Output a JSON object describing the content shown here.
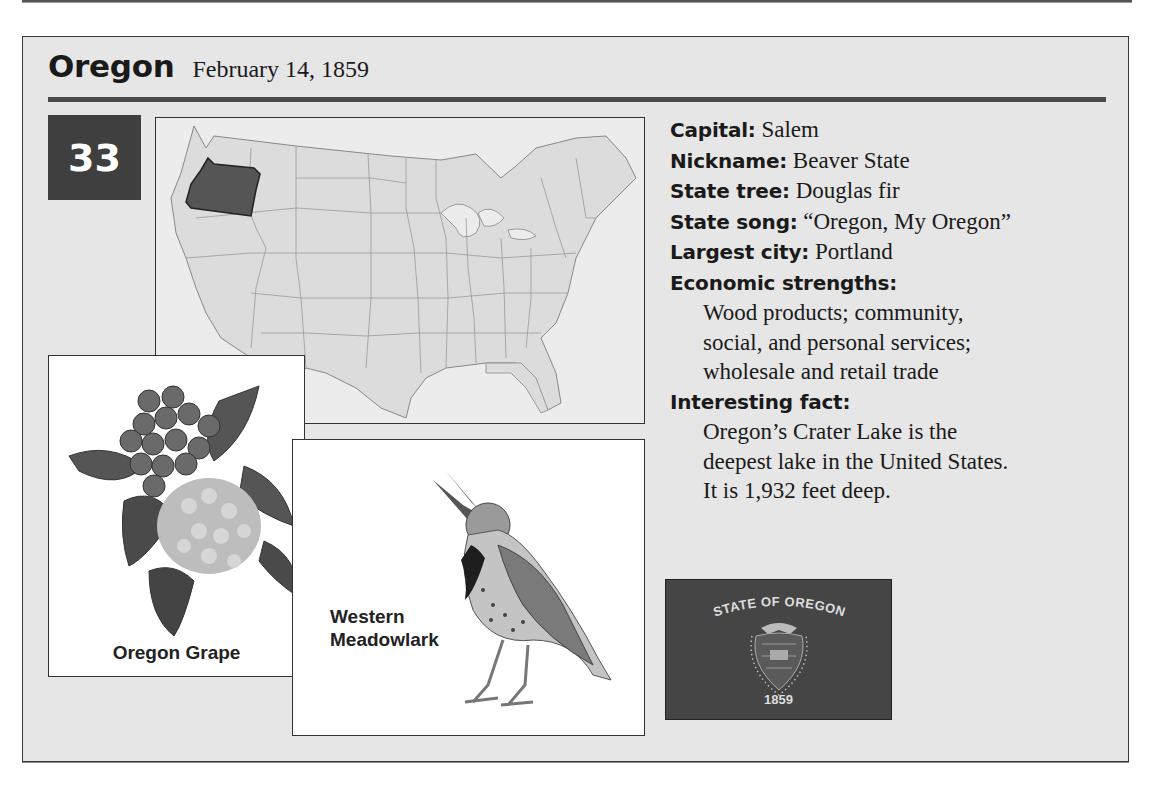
{
  "header": {
    "state_name": "Oregon",
    "admission_date": "February 14, 1859",
    "order_number": "33"
  },
  "map": {
    "highlighted_state": "Oregon",
    "highlight_color": "#555555",
    "base_color": "#dcdcdc"
  },
  "illustrations": {
    "state_flower": {
      "label": "Oregon Grape"
    },
    "state_bird": {
      "label_line1": "Western",
      "label_line2": "Meadowlark"
    }
  },
  "facts": {
    "capital": {
      "label": "Capital:",
      "value": "Salem"
    },
    "nickname": {
      "label": "Nickname:",
      "value": "Beaver State"
    },
    "state_tree": {
      "label": "State tree:",
      "value": "Douglas fir"
    },
    "state_song": {
      "label": "State song:",
      "value": "“Oregon, My Oregon”"
    },
    "largest_city": {
      "label": "Largest city:",
      "value": "Portland"
    },
    "economic_strengths": {
      "label": "Economic strengths:",
      "lines": [
        "Wood products; community,",
        "social, and personal services;",
        "wholesale and retail trade"
      ]
    },
    "interesting_fact": {
      "label": "Interesting fact:",
      "lines": [
        "Oregon’s Crater Lake is the",
        "deepest lake in the United States.",
        "It is 1,932 feet deep."
      ]
    }
  },
  "flag": {
    "top_text": "STATE OF OREGON",
    "year": "1859",
    "background_color": "#454545"
  }
}
